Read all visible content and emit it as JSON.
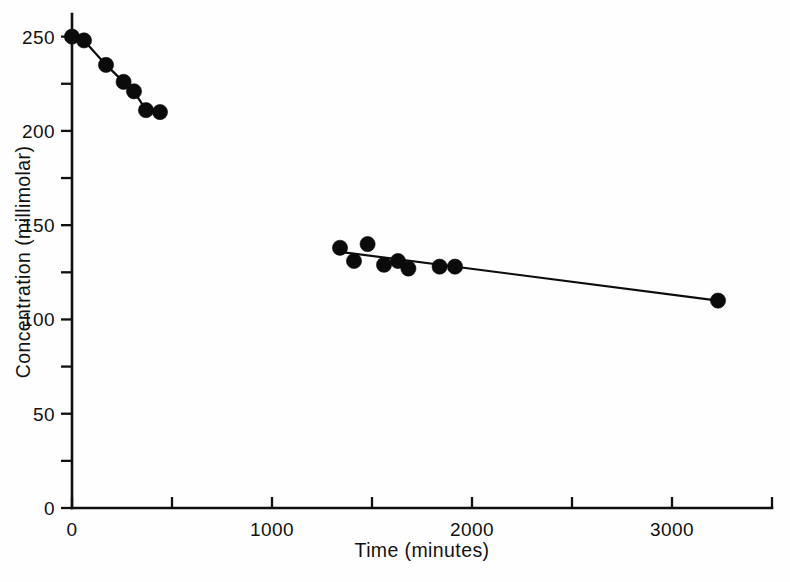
{
  "chart_data": {
    "type": "scatter",
    "title": "",
    "xlabel": "Time (minutes)",
    "ylabel": "Concentration (millimolar)",
    "xlim": [
      0,
      3500
    ],
    "ylim": [
      0,
      262
    ],
    "grid": false,
    "legend": "none",
    "x_ticks": [
      0,
      1000,
      2000,
      3000
    ],
    "x_tick_labels": [
      "0",
      "1000",
      "2000",
      "3000"
    ],
    "x_minor_ticks": [
      500,
      1500,
      2500,
      3500
    ],
    "y_ticks": [
      0,
      50,
      100,
      150,
      200,
      250
    ],
    "y_tick_labels": [
      "0",
      "50",
      "100",
      "150",
      "200",
      "250"
    ],
    "y_minor_ticks": [
      25,
      75,
      125,
      175,
      225
    ],
    "marker": "filled-circle",
    "marker_color": "#0b0b0b",
    "line_color": "#0d0d0d",
    "series": [
      {
        "name": "upper-segment",
        "connected": true,
        "points": [
          {
            "x": 0,
            "y": 250
          },
          {
            "x": 60,
            "y": 248
          },
          {
            "x": 170,
            "y": 235
          },
          {
            "x": 258,
            "y": 226
          },
          {
            "x": 310,
            "y": 221
          },
          {
            "x": 370,
            "y": 211
          },
          {
            "x": 440,
            "y": 210
          }
        ]
      },
      {
        "name": "lower-segment",
        "connected": true,
        "fit_line": [
          {
            "x": 1330,
            "y": 136
          },
          {
            "x": 3230,
            "y": 110
          }
        ],
        "points": [
          {
            "x": 1340,
            "y": 138
          },
          {
            "x": 1410,
            "y": 131
          },
          {
            "x": 1478,
            "y": 140
          },
          {
            "x": 1560,
            "y": 129
          },
          {
            "x": 1630,
            "y": 131
          },
          {
            "x": 1682,
            "y": 127
          },
          {
            "x": 1838,
            "y": 128
          },
          {
            "x": 1915,
            "y": 128
          },
          {
            "x": 3230,
            "y": 110
          }
        ]
      }
    ]
  }
}
